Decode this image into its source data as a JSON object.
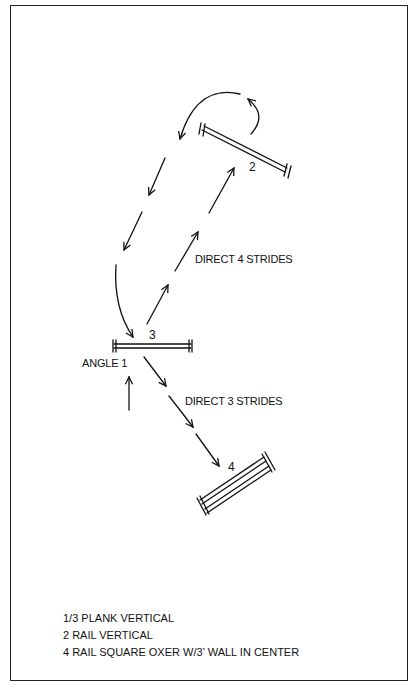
{
  "diagram": {
    "type": "show-jumping course map",
    "fences": [
      {
        "id": "2",
        "label": "2",
        "kind": "rail vertical"
      },
      {
        "id": "3",
        "label": "3",
        "kind": "plank vertical"
      },
      {
        "id": "4",
        "label": "4",
        "kind": "rail square oxer"
      }
    ],
    "annotations": {
      "direct4": "DIRECT 4 STRIDES",
      "direct3": "DIRECT 3 STRIDES",
      "angle1": "ANGLE 1"
    },
    "legend": [
      "1/3  PLANK VERTICAL",
      "2  RAIL VERTICAL",
      "4  RAIL SQUARE OXER W/3’ WALL IN CENTER"
    ],
    "colors": {
      "ink": "#111111",
      "background": "#ffffff",
      "border": "#222222"
    }
  }
}
